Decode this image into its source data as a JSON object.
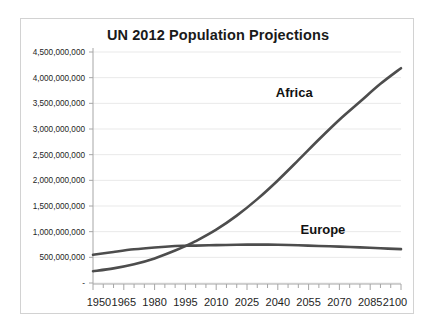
{
  "chart_data": {
    "type": "line",
    "title": "UN 2012 Population Projections",
    "xlabel": "",
    "ylabel": "",
    "xlim": [
      1950,
      2100
    ],
    "ylim": [
      0,
      4500000000
    ],
    "grid": true,
    "legend_position": "inline-annotation",
    "x_tick_labels": [
      "1950",
      "1965",
      "1980",
      "1995",
      "2010",
      "2025",
      "2040",
      "2055",
      "2070",
      "2085",
      "2100"
    ],
    "x_tick_values": [
      1950,
      1965,
      1980,
      1995,
      2010,
      2025,
      2040,
      2055,
      2070,
      2085,
      2100
    ],
    "x_minor_tick_interval": 5,
    "y_tick_labels": [
      "-",
      "500,000,000",
      "1,000,000,000",
      "1,500,000,000",
      "2,000,000,000",
      "2,500,000,000",
      "3,000,000,000",
      "3,500,000,000",
      "4,000,000,000",
      "4,500,000,000"
    ],
    "y_tick_values": [
      0,
      500000000,
      1000000000,
      1500000000,
      2000000000,
      2500000000,
      3000000000,
      3500000000,
      4000000000,
      4500000000
    ],
    "x": [
      1950,
      1960,
      1970,
      1980,
      1990,
      1995,
      2000,
      2010,
      2020,
      2030,
      2040,
      2050,
      2060,
      2070,
      2080,
      2090,
      2100
    ],
    "series": [
      {
        "name": "Africa",
        "color": "#4d4d4d",
        "label_x": 2048,
        "label_y": 3620000000,
        "values": [
          230000000,
          285000000,
          365000000,
          478000000,
          632000000,
          718000000,
          814000000,
          1039000000,
          1312000000,
          1634000000,
          1998000000,
          2393000000,
          2795000000,
          3180000000,
          3530000000,
          3880000000,
          4185000000
        ]
      },
      {
        "name": "Europe",
        "color": "#4d4d4d",
        "label_x": 2062,
        "label_y": 945000000,
        "values": [
          549000000,
          605000000,
          656000000,
          693000000,
          721000000,
          727000000,
          729000000,
          738000000,
          745000000,
          748000000,
          744000000,
          734000000,
          722000000,
          709000000,
          694000000,
          677000000,
          659000000
        ]
      }
    ],
    "annotations": [
      {
        "text": "Africa",
        "x": 2048,
        "y": 3620000000
      },
      {
        "text": "Europe",
        "x": 2062,
        "y": 945000000
      }
    ]
  },
  "colors": {
    "series_line": "#4d4d4d",
    "gridline": "#e9e9e9",
    "axis": "#a6a6a6",
    "text": "#1e1e1e",
    "card_border": "#d2d2d2",
    "background": "#ffffff"
  }
}
